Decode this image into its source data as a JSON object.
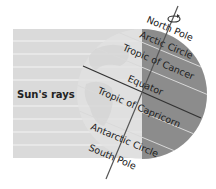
{
  "diagram": {
    "sun_rays_label": "Sun's rays",
    "labels": {
      "north_pole": "North Pole",
      "arctic_circle": "Arctic Circle",
      "tropic_of_cancer": "Tropic of Cancer",
      "equator": "Equator",
      "tropic_of_capricorn": "Tropic of Capricorn",
      "antarctic_circle": "Antarctic Circle",
      "south_pole": "South Pole"
    },
    "icons": {
      "rotation": "rotation-arrow-icon"
    },
    "colors": {
      "rays_background": "#dadada",
      "ray_lines": "#f4f4f4",
      "globe_day": "#e2e2e2",
      "globe_night": "#8c8c8c",
      "axis": "#555555",
      "equator": "#333333",
      "latitude_lines": "#d8d8d8",
      "text": "#222222"
    },
    "axis_tilt_degrees": 23.5
  }
}
